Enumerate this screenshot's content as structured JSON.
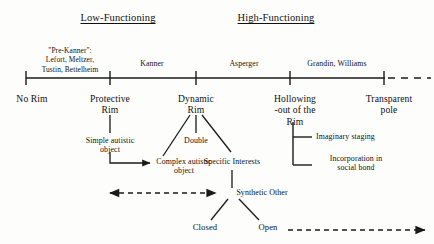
{
  "figure": {
    "background_color": "#fdfdfb",
    "line_color": "#1a1a1a",
    "text_color": "#111111",
    "headings": {
      "low": "Low-Functioning",
      "high": "High-Functioning"
    },
    "axis": {
      "era_labels": [
        "\"Pre-Kanner\":\nLefort, Meltzer,\nTustin, Bettelheim",
        "Kanner",
        "Asperger",
        "Grandin, Williams"
      ],
      "pole_labels": [
        "No Rim",
        "Protective\nRim",
        "Dynamic\nRim",
        "Hollowing\n-out of the\nRim",
        "Transparent\npole"
      ]
    },
    "nodes": {
      "simple_autistic_object": "Simple autistic\nobject",
      "complex_autistic_object": "Complex autistic\nobject",
      "double": "Double",
      "specific_interests": "Specific Interests",
      "imaginary_staging": "Imaginary staging",
      "incorporation": "Incorporation in\nsocial bond",
      "synthetic_other": "Synthetic Other",
      "closed": "Closed",
      "open": "Open"
    }
  }
}
